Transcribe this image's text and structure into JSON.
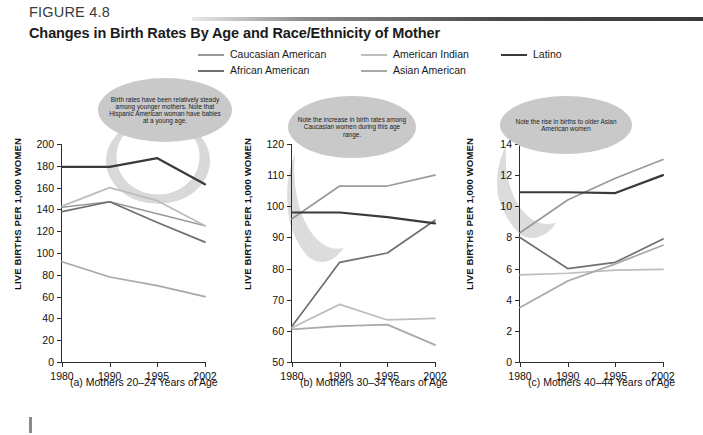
{
  "figure": {
    "label": "FIGURE 4.8",
    "title": "Changes in Birth Rates By Age and Race/Ethnicity of Mother"
  },
  "legend": {
    "position": "top",
    "items": [
      {
        "label": "Caucasian American",
        "color": "#9a9a9a"
      },
      {
        "label": "African American",
        "color": "#6f6f6f"
      },
      {
        "label": "American Indian",
        "color": "#bdbdbd"
      },
      {
        "label": "Asian American",
        "color": "#a8a8a8"
      },
      {
        "label": "Latino",
        "color": "#3a3a3a"
      }
    ]
  },
  "callouts": [
    {
      "id": "callout-a",
      "text": "Birth rates have been relatively steady among younger mothers. Note that Hispanic American woman have babies at a young age."
    },
    {
      "id": "callout-b",
      "text": "Note the increase in birth rates among Caucasian women during this age range."
    },
    {
      "id": "callout-c",
      "text": "Note the rise in births to older Asian American women"
    }
  ],
  "chart_data": [
    {
      "id": "chart-a",
      "type": "line",
      "title": "(a) Mothers 20–24 Years of Age",
      "xlabel": "",
      "ylabel": "LIVE BIRTHS PER 1,000 WOMEN",
      "x": [
        "1980",
        "1990",
        "1995",
        "2002"
      ],
      "xlim": [
        0,
        3
      ],
      "ylim": [
        0,
        200
      ],
      "yticks": [
        0,
        20,
        40,
        60,
        80,
        100,
        120,
        140,
        160,
        180,
        200
      ],
      "grid": false,
      "series": [
        {
          "name": "Caucasian American",
          "color": "#9a9a9a",
          "values": [
            142,
            147,
            136,
            125
          ]
        },
        {
          "name": "African American",
          "color": "#6f6f6f",
          "values": [
            138,
            147,
            128,
            110
          ]
        },
        {
          "name": "American Indian",
          "color": "#bdbdbd",
          "values": [
            143,
            160,
            148,
            125
          ]
        },
        {
          "name": "Asian American",
          "color": "#a8a8a8",
          "values": [
            92,
            78,
            70,
            60
          ]
        },
        {
          "name": "Latino",
          "color": "#3a3a3a",
          "values": [
            179,
            179,
            187,
            163
          ]
        }
      ]
    },
    {
      "id": "chart-b",
      "type": "line",
      "title": "(b) Mothers 30–34 Years of Age",
      "xlabel": "",
      "ylabel": "LIVE BIRTHS PER 1,000 WOMEN",
      "x": [
        "1980",
        "1990",
        "1995",
        "2002"
      ],
      "xlim": [
        0,
        3
      ],
      "ylim": [
        50,
        120
      ],
      "yticks": [
        50,
        60,
        70,
        80,
        90,
        100,
        110,
        120
      ],
      "grid": false,
      "series": [
        {
          "name": "Caucasian American",
          "color": "#9a9a9a",
          "values": [
            96,
            106.5,
            106.5,
            110
          ]
        },
        {
          "name": "African American",
          "color": "#6f6f6f",
          "values": [
            61.5,
            82,
            85,
            95.5
          ]
        },
        {
          "name": "American Indian",
          "color": "#bdbdbd",
          "values": [
            61,
            68.5,
            63.5,
            64
          ]
        },
        {
          "name": "Asian American",
          "color": "#a8a8a8",
          "values": [
            60.5,
            61.5,
            62,
            55.5
          ]
        },
        {
          "name": "Latino",
          "color": "#3a3a3a",
          "values": [
            98,
            98,
            96.5,
            94.5
          ]
        }
      ]
    },
    {
      "id": "chart-c",
      "type": "line",
      "title": "(c) Mothers 40–44 Years of Age",
      "xlabel": "",
      "ylabel": "LIVE BIRTHS PER 1,000 WOMEN",
      "x": [
        "1980",
        "1990",
        "1995",
        "2002"
      ],
      "xlim": [
        0,
        3
      ],
      "ylim": [
        0,
        14
      ],
      "yticks": [
        0,
        2,
        4,
        6,
        8,
        10,
        12,
        14
      ],
      "grid": false,
      "series": [
        {
          "name": "Caucasian American",
          "color": "#9a9a9a",
          "values": [
            8.3,
            10.4,
            11.8,
            13.0
          ]
        },
        {
          "name": "African American",
          "color": "#6f6f6f",
          "values": [
            8.0,
            6.0,
            6.4,
            7.9
          ]
        },
        {
          "name": "American Indian",
          "color": "#bdbdbd",
          "values": [
            5.6,
            5.7,
            5.9,
            5.95
          ]
        },
        {
          "name": "Asian American",
          "color": "#a8a8a8",
          "values": [
            3.5,
            5.2,
            6.3,
            7.5
          ]
        },
        {
          "name": "Latino",
          "color": "#3a3a3a",
          "values": [
            10.9,
            10.9,
            10.85,
            12.0
          ]
        }
      ]
    }
  ]
}
